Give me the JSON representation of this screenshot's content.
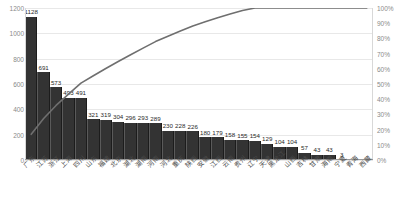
{
  "chart_data": {
    "type": "bar",
    "title": "",
    "subtitle": "",
    "xlabel": "",
    "ylabel": "",
    "y2label": "",
    "grid": true,
    "legend": "none",
    "ylim": [
      0,
      1200
    ],
    "y2lim": [
      0,
      100
    ],
    "yticks": [
      "0",
      "200",
      "400",
      "600",
      "800",
      "1000",
      "1200"
    ],
    "ytick_values": [
      0,
      200,
      400,
      600,
      800,
      1000,
      1200
    ],
    "y2ticks": [
      "0%",
      "10%",
      "20%",
      "30%",
      "40%",
      "50%",
      "60%",
      "70%",
      "80%",
      "90%",
      "100%"
    ],
    "y2tick_values": [
      0,
      10,
      20,
      30,
      40,
      50,
      60,
      70,
      80,
      90,
      100
    ],
    "categories": [
      "广东",
      "江苏",
      "浙江",
      "上海",
      "四川",
      "山东",
      "福建",
      "北京",
      "湖北",
      "湖南",
      "河南",
      "河北",
      "重庆",
      "陕西",
      "安徽",
      "江西",
      "云南",
      "贵州",
      "辽宁",
      "天津",
      "黑龙江",
      "山西",
      "吉林",
      "甘肃",
      "海南",
      "宁夏",
      "青海",
      "西藏"
    ],
    "values": [
      1128,
      691,
      573,
      493,
      491,
      321,
      319,
      304,
      296,
      293,
      289,
      230,
      228,
      226,
      180,
      179,
      158,
      155,
      154,
      129,
      104,
      104,
      57,
      43,
      43,
      3,
      3,
      3
    ],
    "value_labels": [
      "1128",
      "691",
      "573",
      "493",
      "491",
      "321",
      "319",
      "304",
      "296",
      "293",
      "289",
      "230",
      "228",
      "226",
      "180",
      "179",
      "158",
      "155",
      "154",
      "129",
      "104",
      "104",
      "57",
      "43",
      "43",
      "3",
      "",
      ""
    ],
    "cumulative_percent": [
      16.9,
      27.3,
      35.9,
      43.3,
      50.6,
      55.4,
      60.2,
      64.8,
      69.2,
      73.6,
      77.9,
      81.4,
      84.8,
      88.2,
      90.9,
      93.6,
      96.0,
      98.3,
      100.0,
      100.0,
      100.0,
      100.0,
      100.0,
      100.0,
      100.0,
      100.0,
      100.0,
      100.0
    ],
    "series": [
      {
        "name": "数量",
        "type": "bar",
        "values": [
          1128,
          691,
          573,
          493,
          491,
          321,
          319,
          304,
          296,
          293,
          289,
          230,
          228,
          226,
          180,
          179,
          158,
          155,
          154,
          129,
          104,
          104,
          57,
          43,
          43,
          3,
          3,
          3
        ]
      },
      {
        "name": "累计占比",
        "type": "line",
        "values": [
          16.9,
          27.3,
          35.9,
          43.3,
          50.6,
          55.4,
          60.2,
          64.8,
          69.2,
          73.6,
          77.9,
          81.4,
          84.8,
          88.2,
          90.9,
          93.6,
          96.0,
          98.3,
          100.0,
          100.0,
          100.0,
          100.0,
          100.0,
          100.0,
          100.0,
          100.0,
          100.0,
          100.0
        ]
      }
    ],
    "colors": {
      "bar": "#333333",
      "line": "#6f6f6f",
      "grid": "#e8e8e8",
      "axis": "#9a9a9a",
      "tick_text": "#8a8a8a",
      "value_text": "#2a2a2a",
      "category_text": "#4a4a4a"
    }
  }
}
